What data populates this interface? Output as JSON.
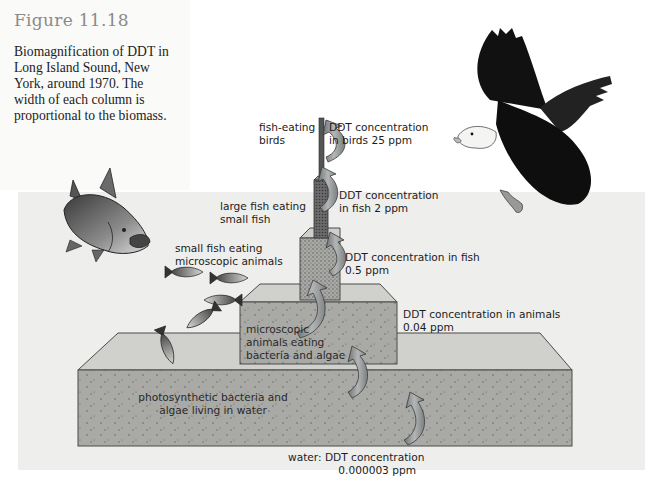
{
  "figure": {
    "number": "Figure 11.18",
    "caption": "Biomagnification of DDT in Long Island Sound, New York, around 1970. The width of each column is proportional to the biomass.",
    "caption_lines": [
      "Biomagnification of DDT in",
      "Long Island Sound, New",
      "York, around 1970. The",
      "width of each column is",
      "proportional to the biomass."
    ]
  },
  "levels": [
    {
      "organism": [
        "fish-eating",
        "birds"
      ],
      "concentration": [
        "DDT concentration",
        "in birds 25 ppm"
      ],
      "ppm": 25
    },
    {
      "organism": [
        "large fish eating",
        "small fish"
      ],
      "concentration": [
        "DDT concentration",
        "in fish 2 ppm"
      ],
      "ppm": 2
    },
    {
      "organism": [
        "small fish eating",
        "microscopic animals"
      ],
      "concentration": [
        "DDT concentration in fish",
        "0.5 ppm"
      ],
      "ppm": 0.5
    },
    {
      "organism": [
        "microscopic",
        "animals eating",
        "bacteria and algae"
      ],
      "concentration": [
        "DDT concentration in animals",
        "0.04 ppm"
      ],
      "ppm": 0.04
    },
    {
      "organism": [
        "photosynthetic bacteria and",
        "algae living in water"
      ],
      "concentration": [
        "water: DDT concentration",
        "0.000003 ppm"
      ],
      "ppm": 3e-06
    }
  ],
  "icons": [
    "eagle-icon",
    "large-fish-icon",
    "small-fish-icon",
    "transfer-arrow-icon"
  ],
  "colors": {
    "background_band": "#eeeeec",
    "column_fill": "#a9a9a6",
    "column_top": "#d2d2cf",
    "arrow_fill": "#8f9393",
    "title_gray": "#8a8a8a"
  }
}
